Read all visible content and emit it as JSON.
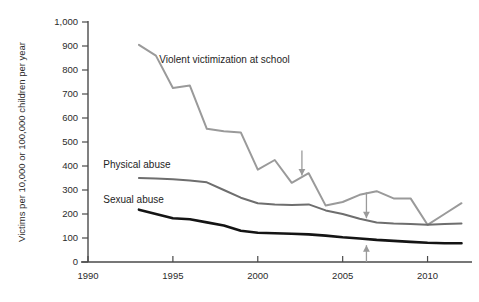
{
  "chart_data": {
    "type": "line",
    "title": "",
    "subtitle": "",
    "xlabel": "",
    "ylabel": "Victims per 10,000 or 100,000 children per year",
    "xlim": [
      1990,
      2012.5
    ],
    "ylim": [
      0,
      1000
    ],
    "grid": false,
    "legend_position": "inline-labels",
    "x_ticks": [
      "1990",
      "1995",
      "2000",
      "2005",
      "2010"
    ],
    "x_tick_values": [
      1990,
      1995,
      2000,
      2005,
      2010
    ],
    "y_ticks": [
      "0",
      "100",
      "200",
      "300",
      "400",
      "500",
      "600",
      "700",
      "800",
      "900",
      "1,000"
    ],
    "y_tick_values": [
      0,
      100,
      200,
      300,
      400,
      500,
      600,
      700,
      800,
      900,
      1000
    ],
    "series": [
      {
        "name": "Violent victimization at school",
        "color": "#9a9a9a",
        "width": 2.0,
        "label_x": 1994.2,
        "label_y": 845,
        "x": [
          1993,
          1994,
          1995,
          1996,
          1997,
          1998,
          1999,
          2000,
          2001,
          2002,
          2003,
          2004,
          2005,
          2006,
          2007,
          2008,
          2009,
          2010,
          2011,
          2012
        ],
        "values": [
          905,
          860,
          725,
          735,
          555,
          545,
          540,
          385,
          425,
          330,
          370,
          235,
          250,
          280,
          295,
          265,
          265,
          155,
          200,
          245
        ]
      },
      {
        "name": "Physical abuse",
        "color": "#6e6e6e",
        "width": 2.0,
        "label_x": 1990.9,
        "label_y": 405,
        "x": [
          1993,
          1994,
          1995,
          1996,
          1997,
          1998,
          1999,
          2000,
          2001,
          2002,
          2003,
          2004,
          2005,
          2006,
          2007,
          2008,
          2009,
          2010,
          2011,
          2012
        ],
        "values": [
          350,
          348,
          345,
          340,
          332,
          300,
          268,
          245,
          240,
          238,
          240,
          215,
          200,
          180,
          165,
          160,
          158,
          155,
          158,
          160
        ]
      },
      {
        "name": "Sexual abuse",
        "color": "#141414",
        "width": 2.6,
        "label_x": 1990.9,
        "label_y": 262,
        "x": [
          1993,
          1994,
          1995,
          1996,
          1997,
          1998,
          1999,
          2000,
          2001,
          2002,
          2003,
          2004,
          2005,
          2006,
          2007,
          2008,
          2009,
          2010,
          2011,
          2012
        ],
        "values": [
          218,
          200,
          182,
          178,
          165,
          152,
          130,
          122,
          120,
          118,
          115,
          110,
          103,
          98,
          92,
          88,
          84,
          80,
          78,
          78
        ]
      }
    ],
    "annotations": [
      {
        "name": "arrow-2003-down",
        "type": "arrow",
        "direction": "down",
        "x": 2002.6,
        "y_from": 465,
        "y_to": 360
      },
      {
        "name": "arrow-2007-down",
        "type": "arrow",
        "direction": "down",
        "x": 2006.4,
        "y_from": 290,
        "y_to": 182
      },
      {
        "name": "arrow-2007-up",
        "type": "arrow",
        "direction": "up",
        "x": 2006.4,
        "y_from": 0,
        "y_to": 70
      }
    ]
  }
}
